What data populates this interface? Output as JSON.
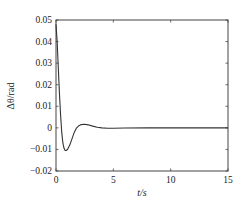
{
  "chart_data": {
    "type": "line",
    "title": "",
    "xlabel": "t/s",
    "ylabel": "Δθ/rad",
    "xlim": [
      0,
      15
    ],
    "ylim": [
      -0.02,
      0.05
    ],
    "grid": false,
    "legend": null,
    "x_ticks": [
      0,
      5,
      10,
      15
    ],
    "x_tick_labels": [
      "0",
      "5",
      "10",
      "15"
    ],
    "y_ticks": [
      -0.02,
      -0.01,
      0,
      0.01,
      0.02,
      0.03,
      0.04,
      0.05
    ],
    "y_tick_labels": [
      "-0.02",
      "-0.01",
      "0",
      "0.01",
      "0.02",
      "0.03",
      "0.04",
      "0.05"
    ],
    "series": [
      {
        "name": "Δθ",
        "color": "#333333",
        "x": [
          0,
          0.1,
          0.2,
          0.3,
          0.4,
          0.5,
          0.6,
          0.7,
          0.8,
          0.9,
          1.0,
          1.2,
          1.4,
          1.6,
          1.8,
          2.0,
          2.2,
          2.5,
          2.8,
          3.2,
          3.6,
          4.0,
          4.5,
          5.0,
          6.0,
          8.0,
          10.0,
          12.0,
          15.0
        ],
        "y": [
          0.048,
          0.04,
          0.028,
          0.016,
          0.006,
          -0.002,
          -0.007,
          -0.0095,
          -0.0105,
          -0.0105,
          -0.01,
          -0.008,
          -0.005,
          -0.002,
          0.0,
          0.001,
          0.0015,
          0.0017,
          0.0014,
          0.0008,
          0.0003,
          0.0,
          -0.0002,
          -0.0002,
          -0.0001,
          0.0,
          0.0,
          0.0,
          0.0
        ]
      }
    ]
  }
}
